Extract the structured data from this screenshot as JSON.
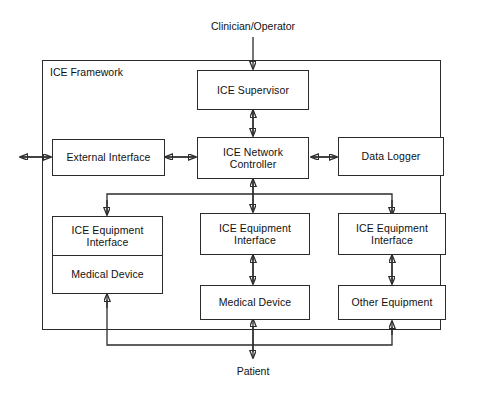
{
  "diagram": {
    "title": "ICE Framework",
    "frame_label": "ICE Framework",
    "external_actors": {
      "top": "Clinician/Operator",
      "bottom": "Patient"
    },
    "nodes": {
      "supervisor": "ICE Supervisor",
      "network_controller": "ICE Network\nController",
      "network_controller_line1": "ICE Network",
      "network_controller_line2": "Controller",
      "external_interface": "External Interface",
      "data_logger": "Data Logger",
      "equip_iface_left_line1": "ICE Equipment",
      "equip_iface_left_line2": "Interface",
      "equip_iface_mid_line1": "ICE Equipment",
      "equip_iface_mid_line2": "Interface",
      "equip_iface_right_line1": "ICE Equipment",
      "equip_iface_right_line2": "Interface",
      "medical_device_left": "Medical Device",
      "medical_device_mid": "Medical Device",
      "other_equipment": "Other Equipment"
    },
    "connections": [
      {
        "from": "Clinician/Operator",
        "to": "ICE Supervisor",
        "type": "arrow-down"
      },
      {
        "from": "ICE Supervisor",
        "to": "ICE Network Controller",
        "type": "bidirectional"
      },
      {
        "from": "External Interface",
        "to": "ICE Network Controller",
        "type": "bidirectional"
      },
      {
        "from": "ICE Network Controller",
        "to": "Data Logger",
        "type": "bidirectional"
      },
      {
        "from": "outside",
        "to": "External Interface",
        "type": "bidirectional"
      },
      {
        "from": "ICE Network Controller",
        "to": "ICE Equipment Interface (left)",
        "type": "arrow-down-bus"
      },
      {
        "from": "ICE Network Controller",
        "to": "ICE Equipment Interface (middle)",
        "type": "bidirectional"
      },
      {
        "from": "ICE Network Controller",
        "to": "ICE Equipment Interface (right)",
        "type": "arrow-down-bus"
      },
      {
        "from": "ICE Equipment Interface (middle)",
        "to": "Medical Device (middle)",
        "type": "bidirectional"
      },
      {
        "from": "ICE Equipment Interface (right)",
        "to": "Other Equipment",
        "type": "bidirectional"
      },
      {
        "from": "Patient",
        "to": "Medical Device (middle)",
        "type": "bidirectional"
      },
      {
        "from": "Patient bus",
        "to": "Medical Device (left)",
        "type": "arrow-up"
      },
      {
        "from": "Patient bus",
        "to": "Other Equipment",
        "type": "arrow-up"
      }
    ],
    "colors": {
      "stroke": "#2b2b2b",
      "background": "#ffffff",
      "text": "#111111"
    }
  }
}
